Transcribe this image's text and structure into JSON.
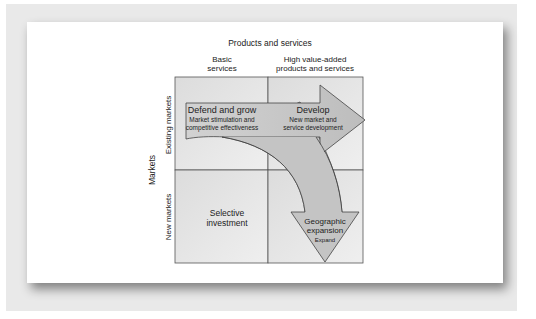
{
  "diagram": {
    "x_axis_title": "Products and services",
    "columns": [
      {
        "line1": "Basic",
        "line2": "services"
      },
      {
        "line1": "High value-added",
        "line2": "products and services"
      }
    ],
    "y_axis_title": "Markets",
    "rows": [
      {
        "label": "Existing markets"
      },
      {
        "label": "New markets"
      }
    ],
    "cells": {
      "defend": {
        "title": "Defend and grow",
        "sub1": "Market stimulation and",
        "sub2": "competitive effectiveness"
      },
      "develop": {
        "title": "Develop",
        "sub1": "New market and",
        "sub2": "service development"
      },
      "selective": {
        "line1": "Selective",
        "line2": "investment"
      },
      "geographic": {
        "line1": "Geographic",
        "line2": "expansion",
        "sub": "Expand"
      }
    },
    "colors": {
      "cell_fill": "#e4e4e4",
      "cell_fill_light": "#ececec",
      "arrow_fill": "#c2c2c2",
      "arrow_head_fill": "#b4b4b4",
      "border": "#555555",
      "background": "#e9e9e9"
    }
  }
}
